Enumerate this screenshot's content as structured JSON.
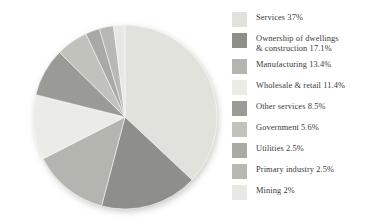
{
  "chart_data": {
    "type": "pie",
    "title": "",
    "subtitle": "",
    "xlabel": "",
    "ylabel": "",
    "grid": false,
    "legend_position": "right",
    "start_angle_deg": 0,
    "direction": "clockwise",
    "total_percent": 100,
    "categories": [
      "Services",
      "Ownership of dwellings & construction",
      "Manufacturing",
      "Wholesale & retail",
      "Other services",
      "Government",
      "Utilities",
      "Primary industry",
      "Mining"
    ],
    "values": [
      37,
      17.1,
      13.4,
      11.4,
      8.5,
      5.6,
      2.5,
      2.5,
      2
    ],
    "colors": [
      "#e2e2dd",
      "#8e8e8b",
      "#b5b5b0",
      "#ebebe7",
      "#9a9a96",
      "#c2c2bd",
      "#a9a9a5",
      "#b9b9b4",
      "#e8e8e4"
    ],
    "slices": [
      {
        "label": "Services",
        "value": 37,
        "value_text": "37%",
        "color": "#e2e2dd"
      },
      {
        "label": "Ownership of dwellings & construction",
        "value": 17.1,
        "value_text": "17.1%",
        "color": "#8e8e8b"
      },
      {
        "label": "Manufacturing",
        "value": 13.4,
        "value_text": "13.4%",
        "color": "#b5b5b0"
      },
      {
        "label": "Wholesale & retail",
        "value": 11.4,
        "value_text": "11.4%",
        "color": "#ebebe7"
      },
      {
        "label": "Other services",
        "value": 8.5,
        "value_text": "8.5%",
        "color": "#9a9a96"
      },
      {
        "label": "Government",
        "value": 5.6,
        "value_text": "5.6%",
        "color": "#c2c2bd"
      },
      {
        "label": "Utilities",
        "value": 2.5,
        "value_text": "2.5%",
        "color": "#a9a9a5"
      },
      {
        "label": "Primary industry",
        "value": 2.5,
        "value_text": "2.5%",
        "color": "#b9b9b4"
      },
      {
        "label": "Mining",
        "value": 2,
        "value_text": "2%",
        "color": "#e8e8e4"
      }
    ]
  },
  "legend": {
    "items": [
      {
        "text": "Services 37%",
        "color": "#e2e2dd"
      },
      {
        "text": "Ownership of dwellings\n& construction 17.1%",
        "color": "#8e8e8b"
      },
      {
        "text": "Manufacturing 13.4%",
        "color": "#b5b5b0"
      },
      {
        "text": "Wholesale & retail 11.4%",
        "color": "#ebebe7"
      },
      {
        "text": "Other services 8.5%",
        "color": "#9a9a96"
      },
      {
        "text": "Government 5.6%",
        "color": "#c2c2bd"
      },
      {
        "text": "Utilities 2.5%",
        "color": "#a9a9a5"
      },
      {
        "text": "Primary industry 2.5%",
        "color": "#b9b9b4"
      },
      {
        "text": "Mining 2%",
        "color": "#e8e8e4"
      }
    ]
  },
  "geometry": {
    "center_x": 125,
    "center_y": 117,
    "radius": 92
  }
}
